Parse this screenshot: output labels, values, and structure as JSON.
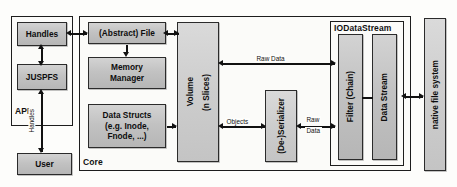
{
  "diagram": {
    "containers": [
      {
        "id": "api",
        "label": "API"
      },
      {
        "id": "core",
        "label": "Core"
      },
      {
        "id": "iodatastream",
        "label": "IODataStream"
      }
    ],
    "boxes": [
      {
        "id": "handles",
        "label": "Handles",
        "orientation": "horizontal"
      },
      {
        "id": "juspfs",
        "label": "JUSPFS",
        "orientation": "horizontal"
      },
      {
        "id": "user",
        "label": "User",
        "orientation": "horizontal"
      },
      {
        "id": "abstract-file",
        "label": "(Abstract) File",
        "orientation": "horizontal"
      },
      {
        "id": "memory-manager",
        "label": "Memory\nManager",
        "orientation": "horizontal"
      },
      {
        "id": "data-structs",
        "label": "Data Structs\n(e.g. Inode,\nFnode, ...)",
        "orientation": "horizontal"
      },
      {
        "id": "volume",
        "label": "Volume\n(n Slices)",
        "orientation": "vertical"
      },
      {
        "id": "serializer",
        "label": "(De-)Serializer",
        "orientation": "vertical"
      },
      {
        "id": "filter-chain",
        "label": "Filter (Chain)",
        "orientation": "vertical"
      },
      {
        "id": "data-stream",
        "label": "Data Stream",
        "orientation": "vertical"
      },
      {
        "id": "native-fs",
        "label": "native file system",
        "orientation": "vertical"
      }
    ],
    "box_lines": {
      "memory_manager_1": "Memory",
      "memory_manager_2": "Manager",
      "data_structs_1": "Data Structs",
      "data_structs_2": "(e.g. Inode,",
      "data_structs_3": "Fnode, ...)",
      "volume_1": "Volume",
      "volume_2": "(n Slices)",
      "handles": "Handles",
      "juspfs": "JUSPFS",
      "user": "User",
      "abstract_file": "(Abstract) File",
      "serializer": "(De-)Serializer",
      "filter_chain": "Filter (Chain)",
      "data_stream": "Data Stream",
      "native_fs": "native file system"
    },
    "edge_labels": [
      {
        "id": "handles-edge",
        "text": "Handles",
        "orientation": "vertical",
        "from": "juspfs",
        "to": "user"
      },
      {
        "id": "raw-data-top",
        "text": "Raw Data",
        "orientation": "horizontal",
        "from": "volume",
        "to": "iodatastream"
      },
      {
        "id": "objects",
        "text": "Objects",
        "orientation": "horizontal",
        "from": "volume",
        "to": "serializer"
      },
      {
        "id": "raw-data-low-1",
        "text": "Raw",
        "orientation": "horizontal",
        "from": "serializer",
        "to": "iodatastream"
      },
      {
        "id": "raw-data-low-2",
        "text": "Data",
        "orientation": "horizontal",
        "from": "serializer",
        "to": "iodatastream"
      }
    ],
    "colors": {
      "box_fill": "#c9c9c9",
      "container_fill": "#fbfbf9",
      "stroke": "#1d1d1d",
      "page_background": "#fdfdfb"
    }
  }
}
